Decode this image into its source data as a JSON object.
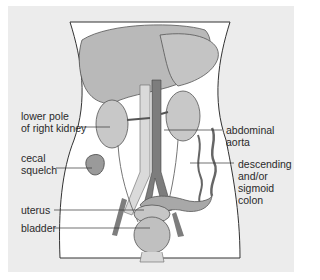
{
  "figure": {
    "type": "anatomical-diagram",
    "colors": {
      "background": "#ececec",
      "body_fill": "#ffffff",
      "organ_fill": "#b5b5b5",
      "aorta_fill": "#7a7a7a",
      "vein_fill": "#d6d6d6",
      "line": "#3a3a3a"
    }
  },
  "labels": {
    "lower_pole_right_kidney": {
      "line1": "lower pole",
      "line2": "of right kidney"
    },
    "abdominal_aorta": {
      "line1": "abdominal",
      "line2": "aorta"
    },
    "cecal_squelch": {
      "line1": "cecal",
      "line2": "squelch"
    },
    "descending_sigmoid_colon": {
      "line1": "descending",
      "line2": "and/or",
      "line3": "sigmoid",
      "line4": "colon"
    },
    "uterus": {
      "line1": "uterus"
    },
    "bladder": {
      "line1": "bladder"
    }
  }
}
